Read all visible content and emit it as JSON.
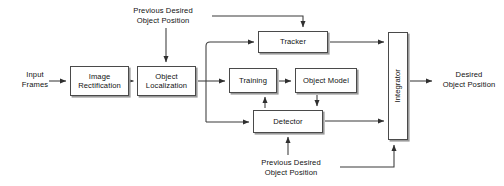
{
  "diagram": {
    "canvas": {
      "width": 504,
      "height": 186
    },
    "colors": {
      "box_stroke": "#4a4a4a",
      "box_shadow": "#9a9a9a",
      "box_fill": "#ffffff",
      "line": "#3a3a3a",
      "text": "#111111",
      "background": "#ffffff"
    },
    "nodes": [
      {
        "id": "image_rectification",
        "label": "Image\nRectification",
        "x": 70,
        "y": 66,
        "w": 59,
        "h": 30,
        "orientation": "horizontal"
      },
      {
        "id": "object_localization",
        "label": "Object\nLocalization",
        "x": 137,
        "y": 66,
        "w": 59,
        "h": 30,
        "orientation": "horizontal"
      },
      {
        "id": "tracker",
        "label": "Tracker",
        "x": 258,
        "y": 31,
        "w": 70,
        "h": 22,
        "orientation": "horizontal"
      },
      {
        "id": "training",
        "label": "Training",
        "x": 229,
        "y": 68,
        "w": 48,
        "h": 25,
        "orientation": "horizontal"
      },
      {
        "id": "object_model",
        "label": "Object Model",
        "x": 295,
        "y": 68,
        "w": 62,
        "h": 25,
        "orientation": "horizontal"
      },
      {
        "id": "detector",
        "label": "Detector",
        "x": 253,
        "y": 110,
        "w": 70,
        "h": 23,
        "orientation": "horizontal"
      },
      {
        "id": "integrator",
        "label": "Integrator",
        "x": 388,
        "y": 32,
        "w": 20,
        "h": 108,
        "orientation": "vertical"
      }
    ],
    "labels": [
      {
        "id": "input_frames",
        "text": "Input\nFrames",
        "x": 14,
        "y": 70,
        "w": 42
      },
      {
        "id": "previous_desired_top",
        "text": "Previous Desired\nObject Position",
        "x": 118,
        "y": 6,
        "w": 90
      },
      {
        "id": "desired_object_position",
        "text": "Desired\nObject Position",
        "x": 436,
        "y": 70,
        "w": 66
      },
      {
        "id": "previous_desired_bottom",
        "text": "Previous Desired\nObject Position",
        "x": 246,
        "y": 158,
        "w": 90
      }
    ],
    "connections": [
      {
        "id": "input-frames-to-image-rectification",
        "from": "input_frames",
        "to": "image_rectification"
      },
      {
        "id": "image-rectification-to-object-localization",
        "from": "image_rectification",
        "to": "object_localization"
      },
      {
        "id": "previous-desired-top-to-object-localization",
        "from": "previous_desired_top",
        "to": "object_localization"
      },
      {
        "id": "previous-desired-top-to-tracker",
        "from": "previous_desired_top",
        "to": "tracker"
      },
      {
        "id": "object-localization-to-tracker",
        "from": "object_localization",
        "to": "tracker"
      },
      {
        "id": "object-localization-to-training",
        "from": "object_localization",
        "to": "training"
      },
      {
        "id": "object-localization-to-detector",
        "from": "object_localization",
        "to": "detector"
      },
      {
        "id": "training-to-object-model",
        "from": "training",
        "to": "object_model"
      },
      {
        "id": "object-model-to-detector",
        "from": "object_model",
        "to": "detector"
      },
      {
        "id": "detector-to-training",
        "from": "detector",
        "to": "training"
      },
      {
        "id": "tracker-to-integrator",
        "from": "tracker",
        "to": "integrator"
      },
      {
        "id": "detector-to-integrator",
        "from": "detector",
        "to": "integrator"
      },
      {
        "id": "integrator-to-desired-object-position",
        "from": "integrator",
        "to": "desired_object_position"
      },
      {
        "id": "previous-desired-bottom-to-detector",
        "from": "previous_desired_bottom",
        "to": "detector"
      },
      {
        "id": "previous-desired-bottom-to-integrator",
        "from": "previous_desired_bottom",
        "to": "integrator"
      }
    ]
  }
}
